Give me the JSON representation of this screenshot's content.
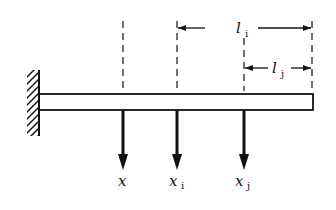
{
  "diagram": {
    "colors": {
      "ink": "#111111",
      "background": "#ffffff"
    },
    "labels": {
      "x": "x",
      "xi_base": "x",
      "xi_sub": "i",
      "xj_base": "x",
      "xj_sub": "j",
      "li_base": "l",
      "li_sub": "i",
      "lj_base": "l",
      "lj_sub": "j"
    },
    "elements": {
      "wall": "fixed support (hatched)",
      "beam": "cantilever beam",
      "arrows": [
        "x",
        "x_i",
        "x_j"
      ],
      "dimensions": [
        "l_i",
        "l_j"
      ]
    }
  }
}
